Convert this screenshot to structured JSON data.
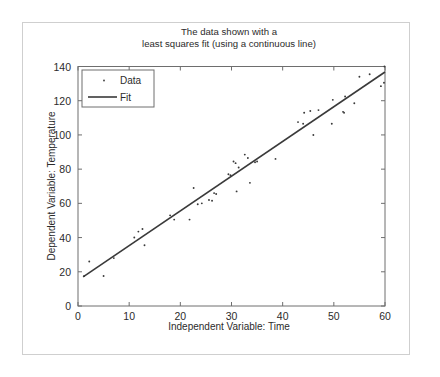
{
  "figure": {
    "background": "#ffffff",
    "frame_border_color": "#cfcfcf",
    "axis_color": "#6e6e6e",
    "ink_color": "#3a3a3a"
  },
  "chart_data": {
    "type": "scatter",
    "title": "The data shown with a\nleast squares fit (using a continuous line)",
    "title_line1": "The data shown with a",
    "title_line2": "least squares fit (using a continuous line)",
    "xlabel": "Independent Variable: Time",
    "ylabel": "Dependent Variable: Temperature",
    "xlim": [
      0,
      60
    ],
    "ylim": [
      0,
      140
    ],
    "xticks": [
      0,
      10,
      20,
      30,
      40,
      50,
      60
    ],
    "yticks": [
      0,
      20,
      40,
      60,
      80,
      100,
      120,
      140
    ],
    "grid": false,
    "legend_position": "upper left",
    "legend": [
      {
        "name": "Data",
        "marker": "dot",
        "style": "marker"
      },
      {
        "name": "Fit",
        "marker": "line",
        "style": "line"
      }
    ],
    "series": [
      {
        "name": "Data",
        "type": "scatter",
        "marker": "dot",
        "color": "#3a3a3a",
        "points": [
          [
            1.2,
            17.5
          ],
          [
            2.2,
            26.0
          ],
          [
            5.0,
            17.5
          ],
          [
            7.0,
            28.0
          ],
          [
            11.0,
            40.0
          ],
          [
            11.8,
            43.5
          ],
          [
            12.6,
            45.0
          ],
          [
            13.0,
            35.5
          ],
          [
            18.0,
            53.0
          ],
          [
            18.8,
            50.5
          ],
          [
            21.8,
            50.5
          ],
          [
            22.6,
            69.0
          ],
          [
            24.2,
            60.0
          ],
          [
            23.4,
            59.5
          ],
          [
            25.6,
            62.0
          ],
          [
            26.2,
            61.5
          ],
          [
            26.6,
            66.0
          ],
          [
            27.0,
            65.5
          ],
          [
            29.4,
            77.0
          ],
          [
            29.8,
            76.5
          ],
          [
            30.4,
            84.5
          ],
          [
            30.8,
            83.5
          ],
          [
            31.0,
            67.0
          ],
          [
            31.4,
            81.0
          ],
          [
            32.6,
            88.5
          ],
          [
            33.2,
            86.5
          ],
          [
            33.6,
            72.0
          ],
          [
            34.6,
            84.0
          ],
          [
            35.0,
            84.5
          ],
          [
            38.6,
            86.0
          ],
          [
            43.0,
            107.5
          ],
          [
            44.0,
            106.5
          ],
          [
            44.2,
            113.0
          ],
          [
            45.4,
            114.0
          ],
          [
            46.0,
            100.0
          ],
          [
            47.0,
            114.5
          ],
          [
            49.8,
            120.5
          ],
          [
            49.6,
            106.5
          ],
          [
            51.8,
            113.5
          ],
          [
            52.0,
            113.0
          ],
          [
            52.2,
            122.5
          ],
          [
            54.0,
            118.5
          ],
          [
            55.0,
            134.0
          ],
          [
            57.0,
            135.5
          ],
          [
            59.2,
            128.5
          ],
          [
            59.8,
            130.5
          ],
          [
            59.9,
            140.0
          ]
        ]
      },
      {
        "name": "Fit",
        "type": "line",
        "color": "#3a3a3a",
        "equation": "y = 15.0 + 2.03x",
        "intercept": 15.0,
        "slope": 2.03,
        "endpoints": [
          [
            1.0,
            17.0
          ],
          [
            60.0,
            136.8
          ]
        ]
      }
    ]
  }
}
